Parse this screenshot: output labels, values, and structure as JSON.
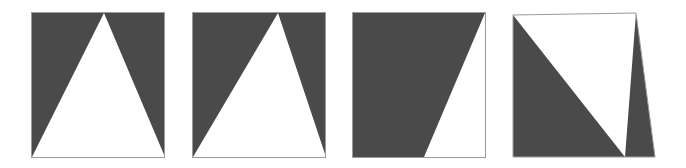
{
  "figure": {
    "name": "triangle-apex-sequence",
    "panel_count": 4,
    "background_color": "#ffffff",
    "fill_color": "#4a4a4a",
    "shape_color": "#ffffff",
    "border_color": "#9a9a9a",
    "canvas": {
      "width": 686,
      "height": 168
    },
    "panels": [
      {
        "id": "panel-1",
        "label": "1",
        "x": 31,
        "y": 12,
        "width": 134,
        "height": 146,
        "polarity": "white-triangle-on-dark",
        "apex_x_fraction": 0.545,
        "base_left_fraction": 0.0,
        "base_right_fraction": 1.0,
        "apex_x_abs": 104,
        "description": "Upward white triangle, apex slightly right of center, base spans full bottom edge"
      },
      {
        "id": "panel-2",
        "label": "2",
        "x": 192,
        "y": 12,
        "width": 134,
        "height": 146,
        "polarity": "white-triangle-on-dark",
        "apex_x_fraction": 0.645,
        "base_left_fraction": 0.0,
        "base_right_fraction": 1.0,
        "apex_x_abs": 278,
        "description": "Upward white triangle, apex shifted further right, base spans full bottom edge"
      },
      {
        "id": "panel-3",
        "label": "3",
        "x": 352,
        "y": 12,
        "width": 134,
        "height": 146,
        "polarity": "white-triangle-on-dark",
        "apex_x_fraction": 1.0,
        "base_left_fraction": 0.54,
        "base_right_fraction": 1.0,
        "apex_x_abs": 486,
        "description": "Apex reaches top-right corner; white region is a right-angled wedge in the lower right"
      },
      {
        "id": "panel-4",
        "label": "4",
        "x": 512,
        "y": 12,
        "width": 144,
        "height": 146,
        "polarity": "dark-triangle-on-white",
        "apex_x_fraction": 0.79,
        "base_left_fraction": 0.0,
        "base_right_fraction": 1.0,
        "apex_x_abs": 625,
        "description": "Inverted polarity: dark downward triangle meeting bottom edge, white above, slight rotation of frame"
      }
    ]
  }
}
